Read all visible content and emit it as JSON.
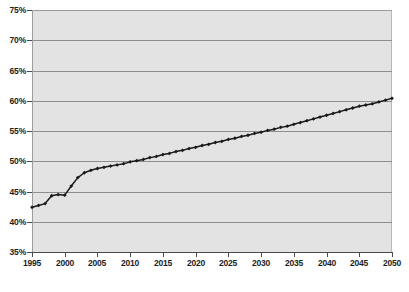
{
  "chart_data": {
    "type": "line",
    "title": "",
    "subtitle": "",
    "xlabel": "",
    "ylabel": "",
    "xlim": [
      1995,
      2050
    ],
    "ylim": [
      35,
      75
    ],
    "grid": true,
    "legend": null,
    "y_tick_labels": [
      "35%",
      "40%",
      "45%",
      "50%",
      "55%",
      "60%",
      "65%",
      "70%",
      "75%"
    ],
    "y_tick_values": [
      35,
      40,
      45,
      50,
      55,
      60,
      65,
      70,
      75
    ],
    "x_tick_labels": [
      "1995",
      "2000",
      "2005",
      "2010",
      "2015",
      "2020",
      "2025",
      "2030",
      "2035",
      "2040",
      "2045",
      "2050"
    ],
    "x_tick_values": [
      1995,
      2000,
      2005,
      2010,
      2015,
      2020,
      2025,
      2030,
      2035,
      2040,
      2045,
      2050
    ],
    "series": [
      {
        "name": "",
        "color": "#1a1a1a",
        "marker": "diamond",
        "x": [
          1995,
          1996,
          1997,
          1998,
          1999,
          2000,
          2001,
          2002,
          2003,
          2004,
          2005,
          2006,
          2007,
          2008,
          2009,
          2010,
          2011,
          2012,
          2013,
          2014,
          2015,
          2016,
          2017,
          2018,
          2019,
          2020,
          2021,
          2022,
          2023,
          2024,
          2025,
          2026,
          2027,
          2028,
          2029,
          2030,
          2031,
          2032,
          2033,
          2034,
          2035,
          2036,
          2037,
          2038,
          2039,
          2040,
          2041,
          2042,
          2043,
          2044,
          2045,
          2046,
          2047,
          2048,
          2049,
          2050
        ],
        "values": [
          42.4,
          42.7,
          43.0,
          44.3,
          44.5,
          44.4,
          45.9,
          47.3,
          48.1,
          48.5,
          48.8,
          49.0,
          49.2,
          49.4,
          49.6,
          49.9,
          50.1,
          50.3,
          50.6,
          50.8,
          51.1,
          51.3,
          51.6,
          51.8,
          52.1,
          52.3,
          52.6,
          52.8,
          53.1,
          53.3,
          53.6,
          53.8,
          54.1,
          54.3,
          54.6,
          54.8,
          55.1,
          55.3,
          55.6,
          55.8,
          56.1,
          56.4,
          56.7,
          57.0,
          57.3,
          57.6,
          57.9,
          58.2,
          58.5,
          58.8,
          59.1,
          59.3,
          59.5,
          59.8,
          60.1,
          60.4
        ]
      }
    ]
  },
  "footer": {
    "ghost_text": ""
  }
}
